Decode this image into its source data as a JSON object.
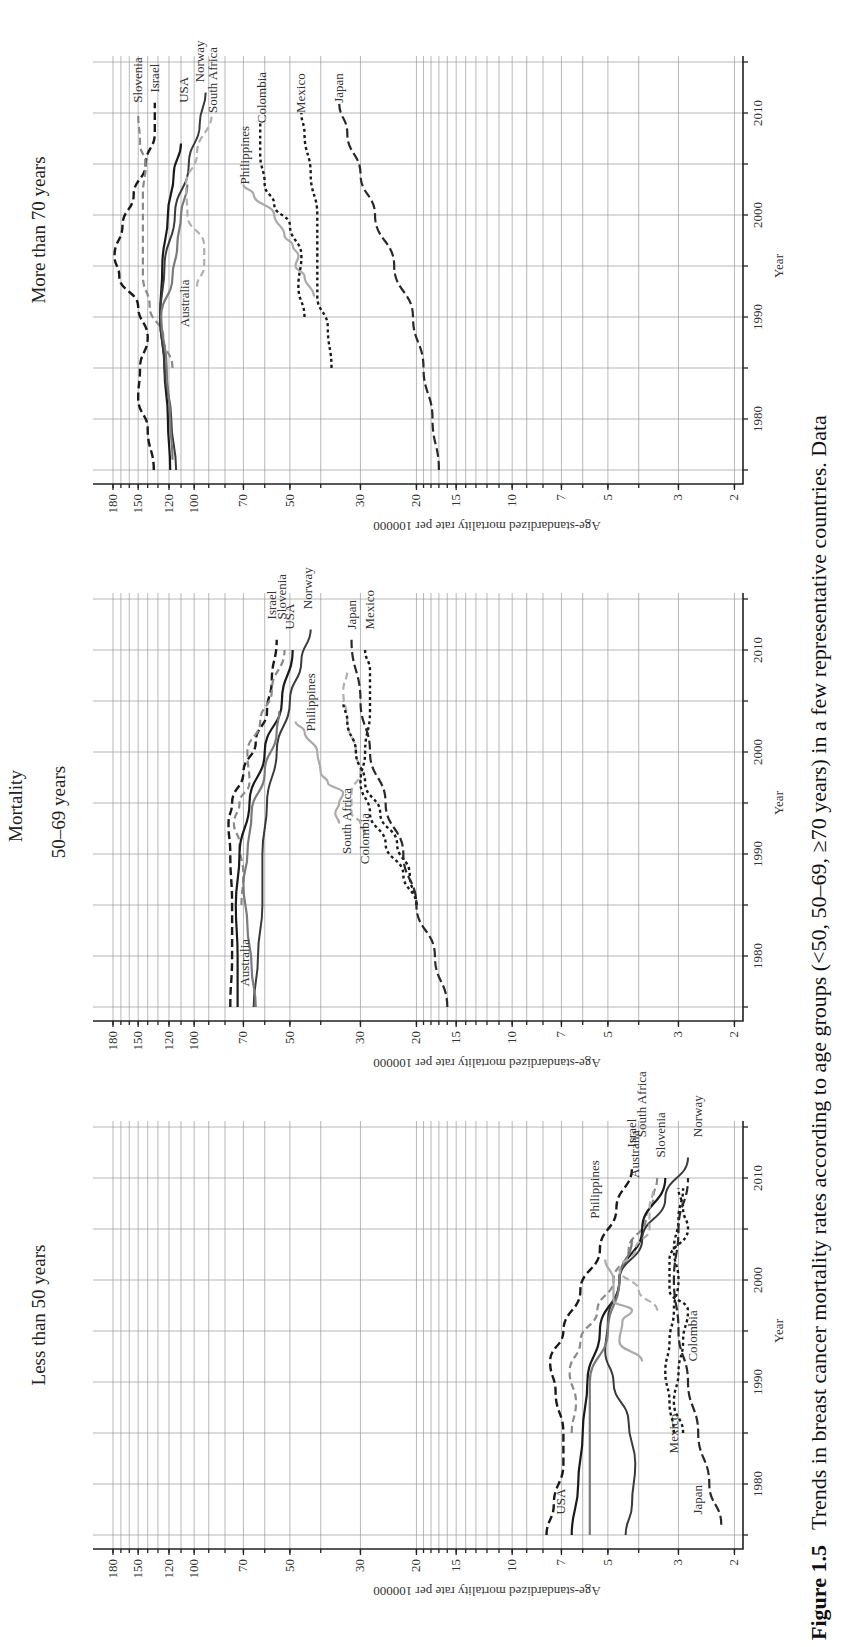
{
  "orientation": "rotated-90-clockwise",
  "heading": "Mortality",
  "caption": {
    "label": "Figure 1.5",
    "text": "Trends in breast cancer mortality rates according to age groups (<50, 50–69, ≥70 years) in a few representative countries. Data"
  },
  "axis": {
    "xlabel": "Year",
    "ylabel": "Age-standardized mortality rate per 100000",
    "year_ticks": [
      "1980",
      "1990",
      "2000",
      "2010"
    ],
    "value_ticks": [
      "180",
      "150",
      "120",
      "100",
      "70",
      "50",
      "30",
      "20",
      "15",
      "10",
      "7",
      "5",
      "3",
      "2"
    ]
  },
  "styles": {
    "Slovenia": {
      "color": "#8a8a8a",
      "dash": "7,4",
      "width": 2.2
    },
    "Israel": {
      "color": "#1a1a1a",
      "dash": "8,4",
      "width": 2.4
    },
    "USA": {
      "color": "#1a1a1a",
      "dash": "",
      "width": 2.2
    },
    "Norway": {
      "color": "#3a3a3a",
      "dash": "",
      "width": 2.0
    },
    "South Africa": {
      "color": "#b0b0b0",
      "dash": "7,4",
      "width": 2.2
    },
    "Australia": {
      "color": "#7a7a7a",
      "dash": "",
      "width": 2.2
    },
    "Philippines": {
      "color": "#aaaaaa",
      "dash": "",
      "width": 2.2
    },
    "Colombia": {
      "color": "#1a1a1a",
      "dash": "3,3",
      "width": 2.4
    },
    "Mexico": {
      "color": "#1a1a1a",
      "dash": "3,3",
      "width": 2.4
    },
    "Japan": {
      "color": "#2a2a2a",
      "dash": "9,4",
      "width": 2.2
    }
  },
  "chart_data": [
    {
      "type": "line",
      "title": "More than 70 years",
      "xlabel": "Year",
      "ylabel": "Age-standardized mortality rate per 100000",
      "yscale": "log",
      "ylim": [
        2,
        180
      ],
      "xlim": [
        1975,
        2015
      ],
      "grid": true,
      "series": [
        {
          "name": "Israel",
          "x": [
            1975,
            1979,
            1982,
            1985,
            1988,
            1991,
            1994,
            1996,
            1999,
            2002,
            2005,
            2008,
            2011
          ],
          "values": [
            134,
            140,
            150,
            148,
            140,
            150,
            172,
            178,
            168,
            155,
            142,
            133,
            133
          ]
        },
        {
          "name": "Slovenia",
          "x": [
            1985,
            1988,
            1991,
            1994,
            1998,
            2002,
            2005,
            2007,
            2010
          ],
          "values": [
            117,
            125,
            138,
            145,
            145,
            145,
            142,
            148,
            150
          ]
        },
        {
          "name": "USA",
          "x": [
            1975,
            1980,
            1985,
            1990,
            1995,
            2000,
            2004,
            2007
          ],
          "values": [
            119,
            121,
            124,
            128,
            126,
            121,
            116,
            110
          ]
        },
        {
          "name": "Norway",
          "x": [
            1975,
            1980,
            1985,
            1990,
            1995,
            2000,
            2005,
            2009,
            2012
          ],
          "values": [
            114,
            118,
            124,
            128,
            124,
            115,
            104,
            96,
            92
          ]
        },
        {
          "name": "Australia",
          "x": [
            1976,
            1980,
            1985,
            1990,
            1994,
            1997,
            2000,
            2003
          ],
          "values": [
            117,
            119,
            122,
            127,
            117,
            113,
            110,
            105
          ]
        },
        {
          "name": "South Africa",
          "x": [
            1993,
            1995,
            1997,
            2000,
            2003,
            2006,
            2010
          ],
          "values": [
            98,
            93,
            93,
            105,
            106,
            98,
            88
          ]
        },
        {
          "name": "Philippines",
          "x": [
            1992,
            1994,
            1995,
            1996,
            1997,
            1998,
            2000,
            2002,
            2003
          ],
          "values": [
            42,
            45,
            48,
            47,
            49,
            52,
            56,
            65,
            70
          ]
        },
        {
          "name": "Colombia",
          "x": [
            1990,
            1993,
            1996,
            1999,
            2001,
            2003,
            2006,
            2009
          ],
          "values": [
            45,
            47,
            46,
            50,
            56,
            60,
            62,
            62
          ]
        },
        {
          "name": "Mexico",
          "x": [
            1985,
            1989,
            1992,
            1996,
            2000,
            2004,
            2008,
            2010
          ],
          "values": [
            37,
            38,
            41,
            41,
            41,
            43,
            45,
            46
          ]
        },
        {
          "name": "Japan",
          "x": [
            1975,
            1980,
            1985,
            1990,
            1995,
            2000,
            2004,
            2008,
            2011
          ],
          "values": [
            17,
            17.8,
            19,
            20.5,
            23.5,
            27,
            30,
            33,
            35
          ]
        }
      ],
      "labels": [
        {
          "text": "Slovenia",
          "x": 2011,
          "v": 150
        },
        {
          "text": "Israel",
          "x": 2012,
          "v": 133
        },
        {
          "text": "USA",
          "x": 2011,
          "v": 108
        },
        {
          "text": "Norway",
          "x": 2013,
          "v": 96
        },
        {
          "text": "South Africa",
          "x": 2010,
          "v": 87
        },
        {
          "text": "Philippines",
          "x": 2003,
          "v": 69
        },
        {
          "text": "Colombia",
          "x": 2009,
          "v": 61
        },
        {
          "text": "Mexico",
          "x": 2010,
          "v": 46
        },
        {
          "text": "Japan",
          "x": 2011,
          "v": 35
        },
        {
          "text": "Australia",
          "x": 1989,
          "v": 107
        }
      ]
    },
    {
      "type": "line",
      "title": "50–69 years",
      "xlabel": "Year",
      "ylabel": "Age-standardized mortality rate per 100000",
      "yscale": "log",
      "ylim": [
        2,
        180
      ],
      "xlim": [
        1975,
        2015
      ],
      "grid": true,
      "series": [
        {
          "name": "Israel",
          "x": [
            1975,
            1980,
            1985,
            1990,
            1993,
            1995,
            1998,
            2001,
            2004,
            2007,
            2011
          ],
          "values": [
            77,
            76,
            76,
            77,
            78,
            76,
            70,
            64,
            59,
            57,
            55
          ]
        },
        {
          "name": "Slovenia",
          "x": [
            1985,
            1988,
            1991,
            1993,
            1995,
            1997,
            2000,
            2003,
            2006,
            2010
          ],
          "values": [
            71,
            70,
            72,
            75,
            72,
            67,
            68,
            62,
            57,
            52
          ]
        },
        {
          "name": "USA",
          "x": [
            1975,
            1980,
            1985,
            1990,
            1995,
            2000,
            2005,
            2010
          ],
          "values": [
            73,
            73,
            74,
            72,
            67,
            60,
            53,
            49
          ]
        },
        {
          "name": "Norway",
          "x": [
            1975,
            1980,
            1985,
            1990,
            1995,
            2000,
            2005,
            2009,
            2012
          ],
          "values": [
            65,
            63,
            61,
            61,
            59,
            55,
            50,
            46,
            43
          ]
        },
        {
          "name": "Australia",
          "x": [
            1975,
            1979,
            1983,
            1987,
            1990,
            1994,
            1998,
            2002,
            2004
          ],
          "values": [
            64,
            66,
            68,
            70,
            68,
            66,
            60,
            55,
            54
          ]
        },
        {
          "name": "South Africa",
          "x": [
            1992,
            1993,
            1994,
            1996,
            1998,
            2000,
            2003,
            2006,
            2008
          ],
          "values": [
            29,
            30,
            32,
            32,
            30,
            31,
            33,
            34,
            33
          ]
        },
        {
          "name": "Philippines",
          "x": [
            1993,
            1994,
            1995,
            1996,
            1997,
            1998,
            2000,
            2002,
            2003
          ],
          "values": [
            35,
            36,
            35,
            34,
            38,
            40,
            41,
            45,
            48
          ]
        },
        {
          "name": "Colombia",
          "x": [
            1985,
            1988,
            1991,
            1994,
            1997,
            2000,
            2003,
            2005
          ],
          "values": [
            20,
            21,
            23,
            26,
            29,
            31,
            33,
            34
          ]
        },
        {
          "name": "Mexico",
          "x": [
            1985,
            1988,
            1991,
            1994,
            1997,
            2000,
            2004,
            2008,
            2010
          ],
          "values": [
            20,
            22,
            25,
            28,
            30,
            29,
            28,
            28,
            29
          ]
        },
        {
          "name": "Japan",
          "x": [
            1975,
            1980,
            1985,
            1990,
            1995,
            2000,
            2005,
            2011
          ],
          "values": [
            16,
            17.5,
            20,
            22,
            25,
            28,
            30,
            32
          ]
        }
      ],
      "labels": [
        {
          "text": "Israel",
          "x": 2013,
          "v": 57
        },
        {
          "text": "Slovenia",
          "x": 2013,
          "v": 53
        },
        {
          "text": "USA",
          "x": 2012,
          "v": 50
        },
        {
          "text": "Norway",
          "x": 2014,
          "v": 44
        },
        {
          "text": "Japan",
          "x": 2012,
          "v": 32
        },
        {
          "text": "Mexico",
          "x": 2012,
          "v": 28
        },
        {
          "text": "Philippines",
          "x": 2002,
          "v": 43
        },
        {
          "text": "South Africa",
          "x": 1990,
          "v": 33
        },
        {
          "text": "Colombia",
          "x": 1989,
          "v": 29
        },
        {
          "text": "Australia",
          "x": 1977,
          "v": 69
        }
      ]
    },
    {
      "type": "line",
      "title": "Less than 50 years",
      "xlabel": "Year",
      "ylabel": "Age-standardized mortality rate per 100000",
      "yscale": "log",
      "ylim": [
        2,
        180
      ],
      "xlim": [
        1975,
        2015
      ],
      "grid": true,
      "series": [
        {
          "name": "Israel",
          "x": [
            1975,
            1978,
            1982,
            1985,
            1989,
            1992,
            1995,
            1999,
            2003,
            2007,
            2011
          ],
          "values": [
            7.8,
            7.4,
            6.9,
            6.9,
            7.3,
            7.6,
            6.9,
            6.1,
            5.3,
            4.7,
            4.2
          ]
        },
        {
          "name": "Slovenia",
          "x": [
            1985,
            1988,
            1991,
            1994,
            1997,
            2000,
            2003,
            2006,
            2008,
            2010
          ],
          "values": [
            6.5,
            6.3,
            6.6,
            6.1,
            5.4,
            4.8,
            4.3,
            3.8,
            3.6,
            3.5
          ]
        },
        {
          "name": "USA",
          "x": [
            1975,
            1980,
            1985,
            1990,
            1995,
            2000,
            2005,
            2010
          ],
          "values": [
            6.5,
            6.2,
            6.0,
            5.8,
            5.3,
            4.6,
            3.9,
            3.3
          ]
        },
        {
          "name": "Norway",
          "x": [
            1975,
            1978,
            1982,
            1986,
            1990,
            1993,
            1996,
            2000,
            2004,
            2008,
            2012
          ],
          "values": [
            4.4,
            4.2,
            4.1,
            4.3,
            4.8,
            5.1,
            5.0,
            4.6,
            3.9,
            3.3,
            2.8
          ]
        },
        {
          "name": "Australia",
          "x": [
            1975,
            1980,
            1985,
            1990,
            1995,
            2000,
            2004
          ],
          "values": [
            5.7,
            5.7,
            5.7,
            5.7,
            5.0,
            4.6,
            4.2
          ]
        },
        {
          "name": "South Africa",
          "x": [
            1997,
            1999,
            2001,
            2003,
            2005,
            2007,
            2009
          ],
          "values": [
            3.5,
            4.0,
            4.6,
            4.1,
            3.7,
            3.7,
            3.6
          ]
        },
        {
          "name": "Philippines",
          "x": [
            1992,
            1994,
            1996,
            1997,
            1998,
            2000,
            2002
          ],
          "values": [
            3.9,
            4.6,
            4.5,
            4.2,
            4.8,
            4.8,
            5.1
          ]
        },
        {
          "name": "Colombia",
          "x": [
            1985,
            1988,
            1991,
            1994,
            1997,
            1999,
            2002,
            2005,
            2007,
            2009
          ],
          "values": [
            2.9,
            3.1,
            3.0,
            2.9,
            2.8,
            3.2,
            3.2,
            2.8,
            2.9,
            3.0
          ]
        },
        {
          "name": "Mexico",
          "x": [
            1985,
            1988,
            1991,
            1994,
            1997,
            2000,
            2003,
            2006,
            2009
          ],
          "values": [
            3.1,
            3.2,
            3.3,
            3.2,
            3.1,
            3.0,
            3.1,
            3.0,
            2.9
          ]
        },
        {
          "name": "Japan",
          "x": [
            1976,
            1980,
            1985,
            1990,
            1995,
            2000,
            2005,
            2010
          ],
          "values": [
            2.2,
            2.4,
            2.6,
            2.8,
            3.0,
            3.1,
            3.0,
            2.8
          ]
        }
      ],
      "labels": [
        {
          "text": "Israel",
          "x": 2013,
          "v": 4.2
        },
        {
          "text": "South Africa",
          "x": 2014,
          "v": 3.9
        },
        {
          "text": "Australia",
          "x": 2010,
          "v": 4.1
        },
        {
          "text": "Slovenia",
          "x": 2012,
          "v": 3.4
        },
        {
          "text": "Norway",
          "x": 2014,
          "v": 2.6
        },
        {
          "text": "Philippines",
          "x": 2006,
          "v": 5.5
        },
        {
          "text": "Colombia",
          "x": 1992,
          "v": 2.7
        },
        {
          "text": "Mexico",
          "x": 1983,
          "v": 3.1
        },
        {
          "text": "Japan",
          "x": 1977,
          "v": 2.6
        },
        {
          "text": "USA",
          "x": 1977,
          "v": 7.0
        }
      ]
    }
  ]
}
